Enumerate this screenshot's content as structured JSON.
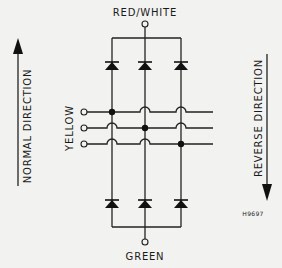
{
  "diagram": {
    "title_top": "RED/WHITE",
    "title_bottom": "GREEN",
    "phase_label": "YELLOW",
    "left_arrow_label": "NORMAL DIRECTION",
    "right_arrow_label": "REVERSE DIRECTION",
    "figure_code": "H9697",
    "colors": {
      "background": "#f2f2f0",
      "ink": "#1a1a1a"
    },
    "structure": {
      "type": "three-phase bridge rectifier",
      "columns": 3,
      "upper_diodes": 3,
      "lower_diodes": 3,
      "phase_inputs": 3,
      "junctions": [
        {
          "phase": 1,
          "column": 1
        },
        {
          "phase": 2,
          "column": 2
        },
        {
          "phase": 3,
          "column": 3
        }
      ]
    }
  }
}
